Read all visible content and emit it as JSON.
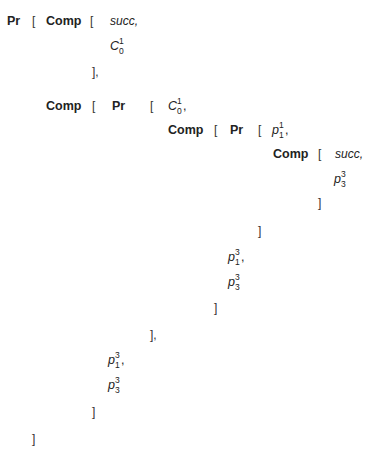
{
  "expression": {
    "rows": [
      {
        "tokens": [
          {
            "id": "r1t1",
            "text": "Pr",
            "kind": "kw",
            "x": 7,
            "y": 14
          },
          {
            "id": "r1t2",
            "text": "[",
            "kind": "br",
            "x": 32,
            "y": 14
          },
          {
            "id": "r1t3",
            "text": "Comp",
            "kind": "kw",
            "x": 46,
            "y": 14
          },
          {
            "id": "r1t4",
            "text": "[",
            "kind": "br",
            "x": 90,
            "y": 14
          },
          {
            "id": "r1t5",
            "text": "succ,",
            "kind": "it",
            "x": 110,
            "y": 14
          }
        ]
      },
      {
        "tokens": [
          {
            "id": "r2t1",
            "base": "C",
            "sub": "0",
            "sup": "1",
            "trail": "",
            "kind": "sym",
            "x": 110,
            "y": 39
          }
        ]
      },
      {
        "tokens": [
          {
            "id": "r3t1",
            "text": "],",
            "kind": "br",
            "x": 92,
            "y": 65
          }
        ]
      },
      {
        "tokens": [
          {
            "id": "r4t1",
            "text": "Comp",
            "kind": "kw",
            "x": 46,
            "y": 99
          },
          {
            "id": "r4t2",
            "text": "[",
            "kind": "br",
            "x": 92,
            "y": 99
          },
          {
            "id": "r4t3",
            "text": "Pr",
            "kind": "kw",
            "x": 112,
            "y": 99
          },
          {
            "id": "r4t4",
            "text": "[",
            "kind": "br",
            "x": 150,
            "y": 99
          },
          {
            "id": "r4t5",
            "base": "C",
            "sub": "0",
            "sup": "1",
            "trail": ",",
            "kind": "sym",
            "x": 168,
            "y": 99
          }
        ]
      },
      {
        "tokens": [
          {
            "id": "r5t1",
            "text": "Comp",
            "kind": "kw",
            "x": 168,
            "y": 123
          },
          {
            "id": "r5t2",
            "text": "[",
            "kind": "br",
            "x": 214,
            "y": 123
          },
          {
            "id": "r5t3",
            "text": "Pr",
            "kind": "kw",
            "x": 230,
            "y": 123
          },
          {
            "id": "r5t4",
            "text": "[",
            "kind": "br",
            "x": 258,
            "y": 123
          },
          {
            "id": "r5t5",
            "base": "p",
            "sub": "1",
            "sup": "1",
            "trail": ",",
            "kind": "sym",
            "x": 272,
            "y": 123
          }
        ]
      },
      {
        "tokens": [
          {
            "id": "r6t1",
            "text": "Comp",
            "kind": "kw",
            "x": 273,
            "y": 147
          },
          {
            "id": "r6t2",
            "text": "[",
            "kind": "br",
            "x": 318,
            "y": 147
          },
          {
            "id": "r6t3",
            "text": "succ,",
            "kind": "it",
            "x": 335,
            "y": 147
          }
        ]
      },
      {
        "tokens": [
          {
            "id": "r7t1",
            "base": "p",
            "sub": "3",
            "sup": "3",
            "trail": "",
            "kind": "sym",
            "x": 334,
            "y": 172
          }
        ]
      },
      {
        "tokens": [
          {
            "id": "r8t1",
            "text": "]",
            "kind": "br",
            "x": 318,
            "y": 196
          }
        ]
      },
      {
        "tokens": [
          {
            "id": "r9t1",
            "text": "]",
            "kind": "br",
            "x": 258,
            "y": 224
          }
        ]
      },
      {
        "tokens": [
          {
            "id": "r10t1",
            "base": "p",
            "sub": "1",
            "sup": "3",
            "trail": ",",
            "kind": "sym",
            "x": 228,
            "y": 250
          }
        ]
      },
      {
        "tokens": [
          {
            "id": "r11t1",
            "base": "p",
            "sub": "3",
            "sup": "3",
            "trail": "",
            "kind": "sym",
            "x": 228,
            "y": 275
          }
        ]
      },
      {
        "tokens": [
          {
            "id": "r12t1",
            "text": "]",
            "kind": "br",
            "x": 214,
            "y": 301
          }
        ]
      },
      {
        "tokens": [
          {
            "id": "r13t1",
            "text": "],",
            "kind": "br",
            "x": 150,
            "y": 328
          }
        ]
      },
      {
        "tokens": [
          {
            "id": "r14t1",
            "base": "p",
            "sub": "1",
            "sup": "3",
            "trail": ",",
            "kind": "sym",
            "x": 108,
            "y": 353
          }
        ]
      },
      {
        "tokens": [
          {
            "id": "r15t1",
            "base": "p",
            "sub": "3",
            "sup": "3",
            "trail": "",
            "kind": "sym",
            "x": 108,
            "y": 378
          }
        ]
      },
      {
        "tokens": [
          {
            "id": "r16t1",
            "text": "]",
            "kind": "br",
            "x": 92,
            "y": 405
          }
        ]
      },
      {
        "tokens": [
          {
            "id": "r17t1",
            "text": "]",
            "kind": "br",
            "x": 32,
            "y": 432
          }
        ]
      }
    ]
  }
}
